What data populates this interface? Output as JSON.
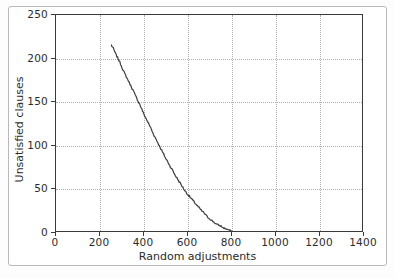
{
  "figure": {
    "background_color": "#ffffff",
    "frame_color": "#b9b9b9",
    "axes_color": "#3a3a3a",
    "grid_color": "#b0b0b0",
    "line_color": "#3c3c3c"
  },
  "chart_data": {
    "type": "line",
    "title": "",
    "xlabel": "Random adjustments",
    "ylabel": "Unsatisfied clauses",
    "xlim": [
      0,
      1400
    ],
    "ylim": [
      0,
      250
    ],
    "xticks": [
      0,
      200,
      400,
      600,
      800,
      1000,
      1200,
      1400
    ],
    "yticks": [
      0,
      50,
      100,
      150,
      200,
      250
    ],
    "xtick_labels": [
      "0",
      "200",
      "400",
      "600",
      "800",
      "1000",
      "1200",
      "1400"
    ],
    "ytick_labels": [
      "0",
      "50",
      "100",
      "150",
      "200",
      "250"
    ],
    "grid": true,
    "grid_style": "dotted",
    "legend": null,
    "series": [
      {
        "name": "Unsatisfied clauses",
        "color": "#3c3c3c",
        "x": [
          0,
          10,
          20,
          30,
          40,
          50,
          60,
          70,
          80,
          90,
          100,
          110,
          120,
          130,
          140,
          150,
          160,
          170,
          180,
          190,
          200,
          210,
          220,
          230,
          240,
          250,
          260,
          270,
          280,
          290,
          300,
          310,
          320,
          330,
          340,
          350,
          360,
          370,
          380,
          390,
          400,
          410,
          420,
          430,
          440,
          450,
          460,
          470,
          480,
          490,
          500,
          510,
          520,
          530,
          540,
          550,
          560,
          570,
          580,
          590,
          600,
          610,
          620,
          630,
          640,
          650,
          660,
          670,
          680,
          690,
          700,
          720,
          740,
          760,
          780,
          800,
          820,
          840,
          860,
          880,
          900,
          920,
          940,
          960,
          980,
          1000,
          1020,
          1040,
          1060,
          1080,
          1100,
          1120,
          1140,
          1160,
          1180,
          1200,
          1220,
          1240,
          1260,
          1280,
          1300,
          1320,
          1340,
          1360,
          1370
        ],
        "y": [
          232,
          228,
          222,
          217,
          212,
          206,
          200,
          195,
          190,
          185,
          180,
          174,
          169,
          164,
          158,
          152,
          147,
          142,
          137,
          131,
          126,
          121,
          116,
          111,
          106,
          101,
          97,
          92,
          88,
          83,
          79,
          75,
          71,
          67,
          63,
          60,
          57,
          54,
          51,
          48,
          45,
          42,
          40,
          37,
          34,
          32,
          30,
          28,
          26,
          25,
          24,
          22,
          21,
          20,
          19,
          18,
          16,
          14,
          12,
          11,
          10,
          9,
          8,
          7,
          6,
          5,
          4,
          3,
          3,
          2,
          2,
          2,
          1,
          1,
          1,
          1,
          1,
          1,
          2,
          2,
          2,
          2,
          1,
          1,
          1,
          1,
          1,
          2,
          1,
          1,
          1,
          1,
          1,
          2,
          2,
          2,
          1,
          1,
          1,
          1,
          1,
          1,
          1,
          1,
          1
        ]
      }
    ]
  }
}
